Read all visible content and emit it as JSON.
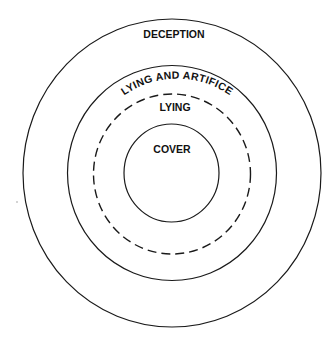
{
  "diagram": {
    "type": "concentric-circles",
    "stroke_color": "#1a1a1a",
    "background": "#ffffff",
    "rings": [
      {
        "id": "deception",
        "label": "DECEPTION",
        "style": "solid",
        "label_placement": "inside-top"
      },
      {
        "id": "lying-and-artifice",
        "label": "LYING AND ARTIFICE",
        "style": "solid",
        "label_placement": "curved-along-top"
      },
      {
        "id": "lying",
        "label": "LYING",
        "style": "dashed",
        "label_placement": "inside-top"
      },
      {
        "id": "cover",
        "label": "COVER",
        "style": "solid",
        "label_placement": "center-top"
      }
    ],
    "nesting": "COVER ⊂ LYING ⊂ LYING AND ARTIFICE ⊂ DECEPTION"
  }
}
